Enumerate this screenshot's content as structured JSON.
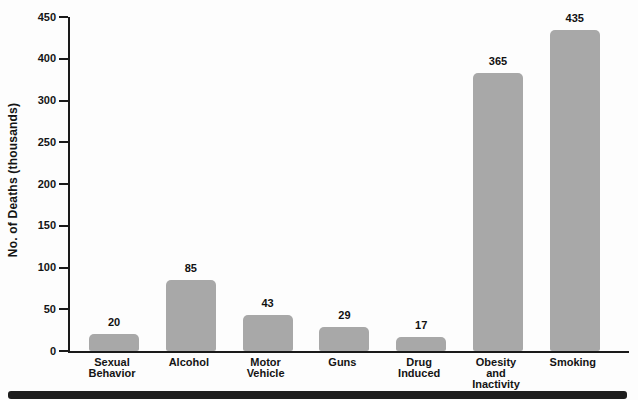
{
  "chart_data": {
    "type": "bar",
    "title": "",
    "xlabel": "",
    "ylabel": "No. of Deaths (thousands)",
    "categories": [
      "Sexual Behavior",
      "Alcohol",
      "Motor Vehicle",
      "Guns",
      "Drug Induced",
      "Obesity and Inactivity",
      "Smoking"
    ],
    "category_label_lines": [
      [
        "Sexual",
        "Behavior"
      ],
      [
        "Alcohol"
      ],
      [
        "Motor",
        "Vehicle"
      ],
      [
        "Guns"
      ],
      [
        "Drug",
        "Induced"
      ],
      [
        "Obesity",
        "and",
        "Inactivity"
      ],
      [
        "Smoking"
      ]
    ],
    "values": [
      20,
      85,
      43,
      29,
      17,
      365,
      435
    ],
    "bar_value_labels": [
      "20",
      "85",
      "43",
      "29",
      "17",
      "365",
      "435"
    ],
    "y_tick_labels_top_to_bottom": [
      "450",
      "400",
      "300",
      "250",
      "200",
      "150",
      "100",
      "50",
      "0"
    ],
    "ylim": [
      0,
      450
    ],
    "grid": "off",
    "legend": "none",
    "bar_color": "#a8a8a8",
    "axis_color": "#1a1a1a",
    "footer_bar_color": "#1d1d1d"
  }
}
